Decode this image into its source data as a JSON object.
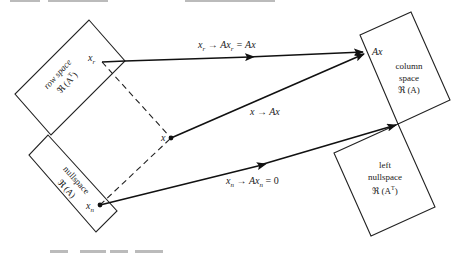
{
  "diagram": {
    "subspaces": {
      "row_space": {
        "line1": "row space",
        "line2": "ℜ (A",
        "sup": "T",
        "close": ")"
      },
      "nullspace": {
        "line1": "nullspace",
        "line2": "ℜ (A)"
      },
      "column_space": {
        "line1": "column",
        "line2": "space",
        "line3": "ℜ (A)"
      },
      "left_nullspace": {
        "line1": "left",
        "line2": "nullspace",
        "line3": "ℜ (A",
        "sup": "T",
        "close": ")"
      }
    },
    "points": {
      "xr": {
        "base": "x",
        "sub": "r"
      },
      "x": {
        "base": "x"
      },
      "xn": {
        "base": "x",
        "sub": "n"
      },
      "Ax": {
        "label": "Ax"
      }
    },
    "mappings": {
      "top": {
        "a": "x",
        "a_sub": "r",
        "arrow": " → ",
        "b": "Ax",
        "b_sub": "r",
        "eq": " = Ax"
      },
      "middle": {
        "label": "x → Ax"
      },
      "bottom": {
        "a": "x",
        "a_sub": "n",
        "arrow": " → ",
        "b": "Ax",
        "b_sub": "n",
        "eq": " = 0"
      }
    }
  },
  "colors": {
    "stroke": "#222222",
    "background": "#ffffff"
  }
}
